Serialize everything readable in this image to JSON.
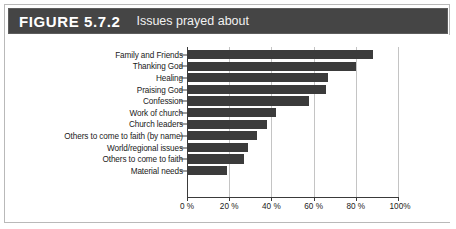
{
  "header": {
    "figure_label": "FIGURE 5.7.2",
    "figure_title": "Issues prayed about",
    "band_color": "#454545"
  },
  "chart_data": {
    "type": "bar",
    "orientation": "horizontal",
    "title": "Issues prayed about",
    "xlabel": "",
    "ylabel": "",
    "xlim": [
      0,
      100
    ],
    "grid": true,
    "legend": "none",
    "bar_color": "#3b3b3b",
    "categories": [
      "Family and Friends",
      "Thanking God",
      "Healing",
      "Praising God",
      "Confession",
      "Work of church",
      "Church leaders",
      "Others to come to faith (by name)",
      "World/regional issues",
      "Others to come to faith",
      "Material needs"
    ],
    "values": [
      88,
      80,
      67,
      66,
      58,
      42,
      38,
      33,
      29,
      27,
      19
    ],
    "xticks": [
      0,
      20,
      40,
      60,
      80,
      100
    ],
    "xticklabels": [
      "0 %",
      "20 %",
      "40 %",
      "60 %",
      "80 %",
      "100%"
    ]
  }
}
